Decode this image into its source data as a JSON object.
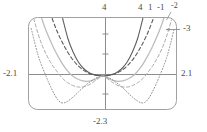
{
  "window": {
    "frame_label": "graphing-window",
    "frame_color": "#9a9a9a",
    "background": "#ffffff"
  },
  "labels": {
    "y_max": "4",
    "x_min": "-2.1",
    "x_max": "2.1",
    "y_min": "-2.3",
    "curve_tags": [
      "4",
      "1",
      "-1",
      "-2",
      "-3"
    ]
  },
  "chart_data": {
    "type": "line",
    "title": "",
    "xlabel": "",
    "ylabel": "",
    "xlim": [
      -2.1,
      2.1
    ],
    "ylim": [
      -2.3,
      4
    ],
    "grid": false,
    "legend": "inline-curve-labels",
    "x_ticks": [
      -2.1,
      2.1
    ],
    "y_ticks": [
      -2.3,
      4
    ],
    "axis_tick_marks": {
      "y": [
        -1,
        1,
        2,
        3
      ],
      "x": []
    },
    "annotations": [
      {
        "text": "4",
        "position": "top-at-y-axis",
        "refers_to": "y-axis maximum value"
      },
      {
        "text": "4",
        "position": "top-right-of-y-axis",
        "refers_to": "curve n = 4"
      },
      {
        "text": "1",
        "position": "top",
        "refers_to": "curve n = 1"
      },
      {
        "text": "-1",
        "position": "top",
        "refers_to": "curve n = -1"
      },
      {
        "text": "-2",
        "position": "top-right",
        "refers_to": "curve n = -2"
      },
      {
        "text": "-3",
        "position": "right-with-leader",
        "refers_to": "curve n = -3"
      },
      {
        "text": "-2.1",
        "position": "left-of-x-axis",
        "refers_to": "x-axis minimum value"
      },
      {
        "text": "2.1",
        "position": "right-of-x-axis",
        "refers_to": "x-axis maximum value"
      },
      {
        "text": "-2.3",
        "position": "bottom-at-y-axis",
        "refers_to": "y-axis minimum value"
      }
    ],
    "series": [
      {
        "name": "4",
        "style": "solid",
        "color": "#5f5f5f",
        "width": 1.1,
        "description": "narrowest upward parabola-like curve, vertex at origin, no dip below axis",
        "points": [
          [
            -1.15,
            4.0
          ],
          [
            -1.0,
            2.6
          ],
          [
            -0.85,
            1.65
          ],
          [
            -0.7,
            0.95
          ],
          [
            -0.55,
            0.5
          ],
          [
            -0.4,
            0.22
          ],
          [
            -0.25,
            0.07
          ],
          [
            -0.1,
            0.01
          ],
          [
            0.0,
            0.0
          ],
          [
            0.1,
            0.01
          ],
          [
            0.25,
            0.07
          ],
          [
            0.4,
            0.22
          ],
          [
            0.55,
            0.5
          ],
          [
            0.7,
            0.95
          ],
          [
            0.85,
            1.65
          ],
          [
            1.0,
            2.6
          ],
          [
            1.15,
            4.0
          ]
        ]
      },
      {
        "name": "1",
        "style": "dashed",
        "color": "#5a5a5a",
        "width": 1.1,
        "description": "second curve, slightly wider, vertex at origin",
        "points": [
          [
            -1.45,
            4.0
          ],
          [
            -1.3,
            3.05
          ],
          [
            -1.1,
            2.05
          ],
          [
            -0.9,
            1.25
          ],
          [
            -0.7,
            0.68
          ],
          [
            -0.5,
            0.3
          ],
          [
            -0.3,
            0.08
          ],
          [
            -0.12,
            0.0
          ],
          [
            0.0,
            -0.02
          ],
          [
            0.12,
            0.0
          ],
          [
            0.3,
            0.08
          ],
          [
            0.5,
            0.3
          ],
          [
            0.7,
            0.68
          ],
          [
            0.9,
            1.25
          ],
          [
            1.1,
            2.05
          ],
          [
            1.3,
            3.05
          ],
          [
            1.45,
            4.0
          ]
        ]
      },
      {
        "name": "-1",
        "style": "solid",
        "color": "#bdbdbd",
        "width": 1.3,
        "description": "light gray curve with shallow dip below x-axis, minima near x = +/-0.9",
        "points": [
          [
            -1.75,
            4.0
          ],
          [
            -1.6,
            3.0
          ],
          [
            -1.4,
            1.9
          ],
          [
            -1.2,
            1.0
          ],
          [
            -1.05,
            0.45
          ],
          [
            -0.9,
            0.05
          ],
          [
            -0.75,
            -0.2
          ],
          [
            -0.6,
            -0.35
          ],
          [
            -0.45,
            -0.4
          ],
          [
            -0.3,
            -0.33
          ],
          [
            -0.15,
            -0.18
          ],
          [
            0.0,
            0.0
          ],
          [
            0.15,
            -0.18
          ],
          [
            0.3,
            -0.33
          ],
          [
            0.45,
            -0.4
          ],
          [
            0.6,
            -0.35
          ],
          [
            0.75,
            -0.2
          ],
          [
            0.9,
            0.05
          ],
          [
            1.05,
            0.45
          ],
          [
            1.2,
            1.0
          ],
          [
            1.4,
            1.9
          ],
          [
            1.6,
            3.0
          ],
          [
            1.75,
            4.0
          ]
        ]
      },
      {
        "name": "-2",
        "style": "dashed",
        "color": "#a8a8a8",
        "width": 1.0,
        "description": "dashed curve, deeper dip, reaches top of window near x = +/-1.95",
        "points": [
          [
            -1.98,
            4.0
          ],
          [
            -1.85,
            2.9
          ],
          [
            -1.7,
            1.9
          ],
          [
            -1.5,
            0.95
          ],
          [
            -1.3,
            0.25
          ],
          [
            -1.15,
            -0.2
          ],
          [
            -1.0,
            -0.5
          ],
          [
            -0.85,
            -0.7
          ],
          [
            -0.7,
            -0.8
          ],
          [
            -0.55,
            -0.78
          ],
          [
            -0.4,
            -0.65
          ],
          [
            -0.25,
            -0.42
          ],
          [
            -0.1,
            -0.15
          ],
          [
            0.0,
            0.0
          ],
          [
            0.1,
            -0.15
          ],
          [
            0.25,
            -0.42
          ],
          [
            0.4,
            -0.65
          ],
          [
            0.55,
            -0.78
          ],
          [
            0.7,
            -0.8
          ],
          [
            0.85,
            -0.7
          ],
          [
            1.0,
            -0.5
          ],
          [
            1.15,
            -0.2
          ],
          [
            1.3,
            0.25
          ],
          [
            1.5,
            0.95
          ],
          [
            1.7,
            1.9
          ],
          [
            1.85,
            2.9
          ],
          [
            1.98,
            4.0
          ]
        ]
      },
      {
        "name": "-3",
        "style": "dotted",
        "color": "#8f8f8f",
        "width": 1.0,
        "description": "dotted outermost curve, deepest dip to about y = -1.9, minima near x = +/-1.25",
        "points": [
          [
            -2.05,
            3.3
          ],
          [
            -1.95,
            2.3
          ],
          [
            -1.85,
            1.4
          ],
          [
            -1.75,
            0.7
          ],
          [
            -1.6,
            -0.2
          ],
          [
            -1.5,
            -0.75
          ],
          [
            -1.4,
            -1.25
          ],
          [
            -1.3,
            -1.65
          ],
          [
            -1.2,
            -1.88
          ],
          [
            -1.1,
            -1.9
          ],
          [
            -1.0,
            -1.78
          ],
          [
            -0.85,
            -1.5
          ],
          [
            -0.7,
            -1.15
          ],
          [
            -0.55,
            -0.8
          ],
          [
            -0.4,
            -0.5
          ],
          [
            -0.25,
            -0.25
          ],
          [
            -0.1,
            -0.06
          ],
          [
            0.0,
            0.0
          ],
          [
            0.1,
            -0.06
          ],
          [
            0.25,
            -0.25
          ],
          [
            0.4,
            -0.5
          ],
          [
            0.55,
            -0.8
          ],
          [
            0.7,
            -1.15
          ],
          [
            0.85,
            -1.5
          ],
          [
            1.0,
            -1.78
          ],
          [
            1.1,
            -1.9
          ],
          [
            1.2,
            -1.88
          ],
          [
            1.3,
            -1.65
          ],
          [
            1.4,
            -1.25
          ],
          [
            1.5,
            -0.75
          ],
          [
            1.6,
            -0.2
          ],
          [
            1.75,
            0.7
          ],
          [
            1.85,
            1.4
          ],
          [
            1.95,
            2.3
          ],
          [
            2.05,
            3.3
          ]
        ]
      }
    ]
  }
}
